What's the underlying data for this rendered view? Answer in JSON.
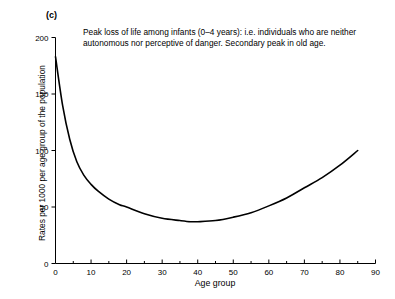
{
  "figure": {
    "panel_label": "(c)",
    "annotation": "Peak loss of life among infants (0–4 years): i.e. individuals\nwho are neither autonomous nor perceptive of danger.\nSecondary peak in old age.",
    "line_color": "#000000",
    "axis_color": "#000000",
    "background_color": "#ffffff"
  },
  "chart_data": {
    "type": "line",
    "title": "",
    "subtitle": "",
    "xlabel": "Age group",
    "ylabel": "Rates per 1000 per age group of the population",
    "xlim": [
      0,
      90
    ],
    "ylim": [
      0,
      200
    ],
    "grid": false,
    "legend": "none",
    "x_ticks": [
      0,
      10,
      20,
      30,
      40,
      50,
      60,
      70,
      80,
      90
    ],
    "x_tick_labels": [
      "0",
      "10",
      "20",
      "30",
      "40",
      "50",
      "60",
      "70",
      "80",
      "90"
    ],
    "x_minor_ticks": [
      5,
      15,
      25,
      35,
      45,
      55,
      65,
      75,
      85
    ],
    "y_ticks": [
      0,
      50,
      100,
      150,
      200
    ],
    "y_tick_labels": [
      "0",
      "50",
      "100",
      "150",
      "200"
    ],
    "annotations": [
      {
        "text": "Peak loss of life among infants (0–4 years): i.e. individuals who are neither autonomous nor perceptive of danger. Secondary peak in old age.",
        "x": 12,
        "y": 192
      }
    ],
    "series": [
      {
        "name": "Mortality rate",
        "x": [
          0,
          2,
          4,
          6,
          8,
          10,
          12,
          15,
          18,
          20,
          25,
          30,
          35,
          38,
          40,
          45,
          50,
          55,
          60,
          65,
          70,
          75,
          80,
          85
        ],
        "values": [
          183,
          140,
          110,
          90,
          78,
          70,
          64,
          57,
          52,
          50,
          44,
          40,
          38,
          37,
          37,
          38,
          41,
          45,
          51,
          58,
          67,
          76,
          87,
          100
        ]
      }
    ]
  }
}
